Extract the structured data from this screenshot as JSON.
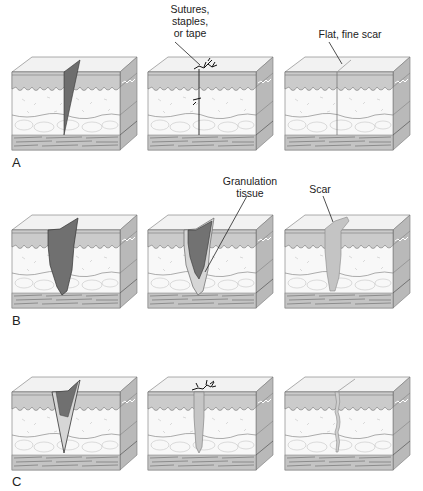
{
  "figure": {
    "rows": [
      {
        "letter": "A",
        "panels": [
          {
            "wound": "open-wedge",
            "label": ""
          },
          {
            "wound": "closed-sutured",
            "label": "Sutures,\nstaples,\nor tape"
          },
          {
            "wound": "fine-line-scar",
            "label": "Flat, fine scar"
          }
        ]
      },
      {
        "letter": "B",
        "panels": [
          {
            "wound": "wide-open",
            "label": ""
          },
          {
            "wound": "granulating",
            "label": "Granulation\ntissue"
          },
          {
            "wound": "large-scar",
            "label": "Scar"
          }
        ]
      },
      {
        "letter": "C",
        "panels": [
          {
            "wound": "open-granulating",
            "label": ""
          },
          {
            "wound": "delayed-closure-sutured",
            "label": ""
          },
          {
            "wound": "moderate-scar",
            "label": ""
          }
        ]
      }
    ],
    "labels": {
      "a_sutures_l1": "Sutures,",
      "a_sutures_l2": "staples,",
      "a_sutures_l3": "or tape",
      "a_scar": "Flat, fine scar",
      "b_gran_l1": "Granulation",
      "b_gran_l2": "tissue",
      "b_scar": "Scar",
      "row_a": "A",
      "row_b": "B",
      "row_c": "C"
    },
    "colors": {
      "top_face": "#f2f2f2",
      "epidermis": "#c9c9c9",
      "dermis": "#f7f7f7",
      "subcut": "#fafafa",
      "muscle": "#bdbdbd",
      "side_face": "#b5b5b5",
      "wound": "#6e6e6e",
      "granulation": "#d4d4d4",
      "scar": "#c2c2c2",
      "line": "#444444"
    }
  }
}
